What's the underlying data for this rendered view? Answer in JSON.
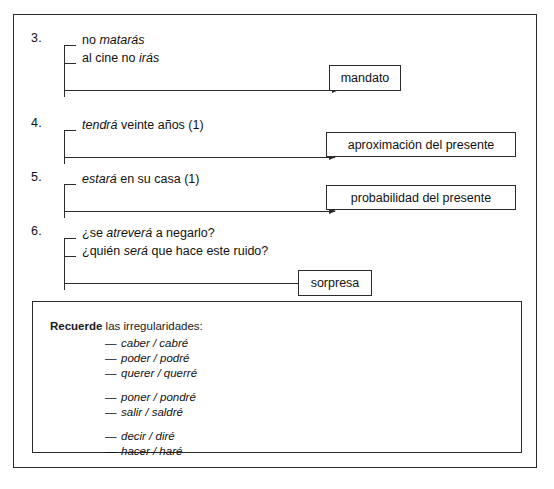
{
  "entries": [
    {
      "number": "3.",
      "lines": [
        {
          "pre": "no ",
          "em": "matarás",
          "post": ""
        },
        {
          "pre": "al cine no ",
          "em": "irás",
          "post": ""
        }
      ],
      "result": "mandato"
    },
    {
      "number": "4.",
      "lines": [
        {
          "pre": "",
          "em": "tendrá",
          "post": " veinte años (1)"
        }
      ],
      "result": "aproximación del presente"
    },
    {
      "number": "5.",
      "lines": [
        {
          "pre": "",
          "em": "estará",
          "post": " en su casa (1)"
        }
      ],
      "result": "probabilidad del presente"
    },
    {
      "number": "6.",
      "lines": [
        {
          "pre": "¿se ",
          "em": "atreverá",
          "post": " a negarlo?"
        },
        {
          "pre": "¿quién ",
          "em": "será",
          "post": " que hace este ruido?"
        }
      ],
      "result": "sorpresa"
    }
  ],
  "note": {
    "title_bold": "Recuerde",
    "title_rest": " las irregularidades:",
    "groups": [
      {
        "items": [
          "caber / cabré",
          "poder / podré",
          "querer / querré"
        ]
      },
      {
        "items": [
          "poner / pondré",
          "salir / saldré"
        ]
      },
      {
        "items": [
          "decir / diré",
          "hacer / haré"
        ]
      }
    ],
    "dash": "—"
  },
  "colors": {
    "ink": "#1a1a1a",
    "rule": "#2a2a2a",
    "background": "#ffffff"
  }
}
